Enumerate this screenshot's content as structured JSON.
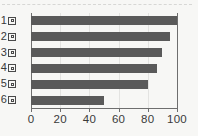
{
  "chart_data": {
    "type": "bar",
    "orientation": "horizontal",
    "title": "",
    "xlabel": "",
    "ylabel": "",
    "categories": [
      "1回",
      "2回",
      "3回",
      "4回",
      "5回",
      "6回"
    ],
    "category_numbers": [
      "1",
      "2",
      "3",
      "4",
      "5",
      "6"
    ],
    "category_glyph": "missing-glyph-box",
    "values": [
      100,
      95,
      90,
      86,
      80,
      50
    ],
    "xlim": [
      0,
      100
    ],
    "xticks": [
      0,
      20,
      40,
      60,
      80,
      100
    ],
    "xtick_labels": [
      "0",
      "20",
      "40",
      "60",
      "80",
      "100"
    ],
    "grid": true,
    "grid_axis": "x",
    "legend": null,
    "bar_color": "#5a5a5a",
    "background_color": "#f7f7f5",
    "gridline_color": "#e3e3e1",
    "axis_color": "#6e6e6e"
  }
}
